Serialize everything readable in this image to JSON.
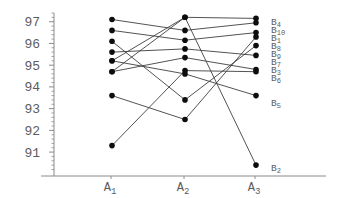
{
  "chart_data": {
    "type": "line",
    "title": "",
    "y_axis": {
      "ticks": [
        97,
        96,
        95,
        94,
        93,
        92,
        91
      ],
      "minor_step": 0.2,
      "range": [
        89.9,
        97.4
      ],
      "grid": false
    },
    "x_axis": {
      "categories": [
        {
          "base": "A",
          "sub": "1"
        },
        {
          "base": "A",
          "sub": "2"
        },
        {
          "base": "A",
          "sub": "3"
        }
      ]
    },
    "legend_position": "right-of-last-point",
    "series": [
      {
        "base": "B",
        "sub": "4",
        "values": [
          95.2,
          97.2,
          97.15
        ],
        "label_at": 97.0
      },
      {
        "base": "B",
        "sub": "10",
        "values": [
          97.1,
          96.6,
          96.95
        ],
        "label_at": 96.63
      },
      {
        "base": "B",
        "sub": "1",
        "values": [
          96.6,
          96.15,
          96.5
        ],
        "label_at": 96.26
      },
      {
        "base": "B",
        "sub": "8",
        "values": [
          93.6,
          92.5,
          96.3
        ],
        "label_at": 95.9
      },
      {
        "base": "B",
        "sub": "9",
        "values": [
          96.1,
          93.4,
          95.9
        ],
        "label_at": 95.53
      },
      {
        "base": "B",
        "sub": "7",
        "values": [
          95.6,
          95.75,
          95.45
        ],
        "label_at": 95.17
      },
      {
        "base": "B",
        "sub": "3",
        "values": [
          94.7,
          95.35,
          94.8
        ],
        "label_at": 94.8
      },
      {
        "base": "B",
        "sub": "6",
        "values": [
          91.3,
          94.75,
          94.7
        ],
        "label_at": 94.43
      },
      {
        "base": "B",
        "sub": "5",
        "values": [
          95.2,
          94.6,
          93.6
        ],
        "label_at": 93.28
      },
      {
        "base": "B",
        "sub": "2",
        "values": [
          94.7,
          97.2,
          90.4
        ],
        "label_at": 90.3
      }
    ],
    "style": {
      "line_color": "#3f3f3f",
      "dot_color": "#0d0d0d",
      "text_color": "#5c5c5c",
      "axis_color": "#8a8a8a",
      "background": "#ffffff"
    }
  }
}
